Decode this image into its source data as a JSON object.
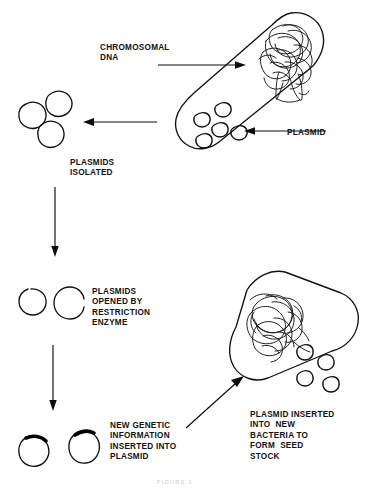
{
  "figure": {
    "title_caption": "FIGURE 1",
    "ink_color": "#111111",
    "background_color": "#ffffff"
  },
  "labels": {
    "chromosomal_dna": "CHROMOSOMAL\nDNA",
    "plasmid": "PLASMID",
    "plasmids_isolated": "PLASMIDS\nISOLATED",
    "plasmids_opened": "PLASMIDS\nOPENED BY\nRESTRICTION\nENZYME",
    "new_genetic_info": "NEW GENETIC\nINFORMATION\nINSERTED INTO\nPLASMID",
    "plasmid_inserted": "PLASMID INSERTED\nINTO  NEW\nBACTERIA TO\nFORM  SEED\nSTOCK"
  },
  "diagram": {
    "type": "process-flow",
    "steps": [
      "Bacterium containing chromosomal DNA and plasmids",
      "Plasmids isolated from bacterium",
      "Plasmids opened by restriction enzyme",
      "New genetic information inserted into plasmid",
      "Plasmid inserted into new bacteria to form seed stock"
    ],
    "bacteria": [
      {
        "name": "source-bacterium",
        "plasmid_count": 5,
        "has_chromosomal_dna": true
      },
      {
        "name": "recipient-bacterium",
        "plasmid_count": 4,
        "has_chromosomal_dna": true
      }
    ],
    "plasmid_groups": [
      {
        "name": "isolated-plasmids",
        "count": 3,
        "state": "closed-circle"
      },
      {
        "name": "opened-plasmids",
        "count": 2,
        "state": "open-gap"
      },
      {
        "name": "recombinant-plasmids",
        "count": 2,
        "state": "closed-with-insert"
      }
    ],
    "arrows": [
      {
        "name": "isolation-arrow",
        "direction": "left"
      },
      {
        "name": "restriction-arrow",
        "direction": "down"
      },
      {
        "name": "insertion-arrow",
        "direction": "down"
      },
      {
        "name": "transformation-arrow",
        "direction": "up-right"
      },
      {
        "name": "chromosomal-dna-pointer",
        "direction": "right"
      },
      {
        "name": "plasmid-pointer",
        "direction": "left"
      }
    ]
  }
}
